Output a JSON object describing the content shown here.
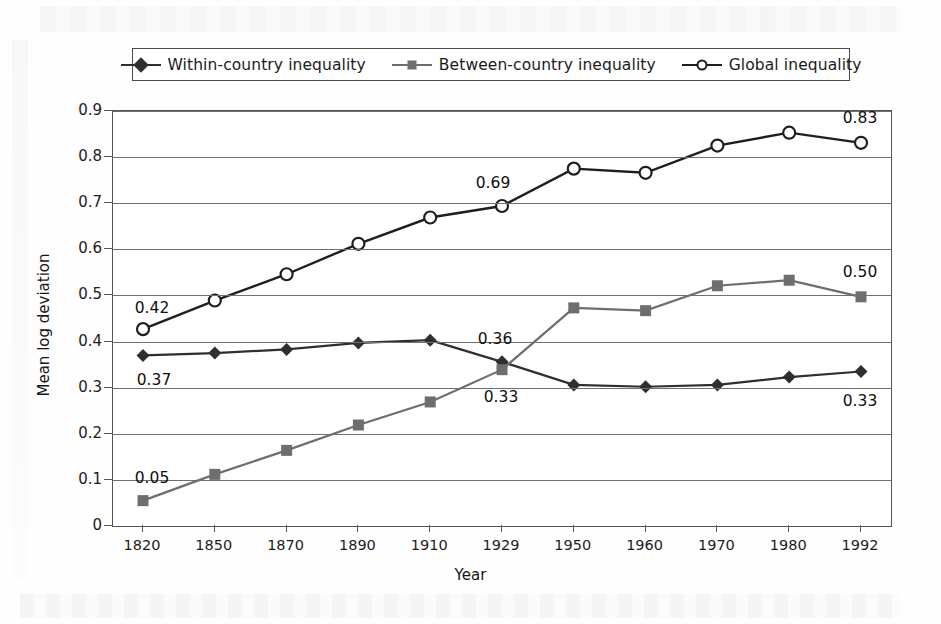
{
  "chart_data": {
    "type": "line",
    "title": "",
    "xlabel": "Year",
    "ylabel": "Mean log deviation",
    "categories": [
      "1820",
      "1850",
      "1870",
      "1890",
      "1910",
      "1929",
      "1950",
      "1960",
      "1970",
      "1980",
      "1992"
    ],
    "ylim": [
      0,
      0.9
    ],
    "ytick_labels": [
      "0",
      "0.1",
      "0.2",
      "0.3",
      "0.4",
      "0.5",
      "0.6",
      "0.7",
      "0.8",
      "0.9"
    ],
    "ytick_values": [
      0,
      0.1,
      0.2,
      0.3,
      0.4,
      0.5,
      0.6,
      0.7,
      0.8,
      0.9
    ],
    "grid": true,
    "legend_position": "top",
    "series": [
      {
        "name": "Within-country inequality",
        "marker": "diamond",
        "color": "#2f2f2f",
        "values": [
          0.37,
          0.375,
          0.383,
          0.397,
          0.403,
          0.356,
          0.306,
          0.302,
          0.306,
          0.323,
          0.335
        ]
      },
      {
        "name": "Between-country inequality",
        "marker": "square",
        "color": "#6e6e6e",
        "values": [
          0.055,
          0.112,
          0.164,
          0.219,
          0.269,
          0.339,
          0.473,
          0.467,
          0.521,
          0.533,
          0.497
        ]
      },
      {
        "name": "Global inequality",
        "marker": "circle",
        "color": "#1e1e1e",
        "values": [
          0.427,
          0.489,
          0.546,
          0.612,
          0.669,
          0.694,
          0.775,
          0.766,
          0.825,
          0.853,
          0.831
        ]
      }
    ],
    "annotations": [
      {
        "text": "0.42",
        "series": "Global inequality",
        "category": "1820",
        "value": 0.427,
        "dx": 10,
        "dy": -20
      },
      {
        "text": "0.37",
        "series": "Within-country inequality",
        "category": "1820",
        "value": 0.37,
        "dx": 12,
        "dy": 26
      },
      {
        "text": "0.05",
        "series": "Between-country inequality",
        "category": "1820",
        "value": 0.055,
        "dx": 10,
        "dy": -22
      },
      {
        "text": "0.69",
        "series": "Global inequality",
        "category": "1929",
        "value": 0.694,
        "dx": -8,
        "dy": -22
      },
      {
        "text": "0.36",
        "series": "Within-country inequality",
        "category": "1929",
        "value": 0.356,
        "dx": -6,
        "dy": -22
      },
      {
        "text": "0.33",
        "series": "Between-country inequality",
        "category": "1929",
        "value": 0.339,
        "dx": 0,
        "dy": 28
      },
      {
        "text": "0.83",
        "series": "Global inequality",
        "category": "1992",
        "value": 0.831,
        "dx": 0,
        "dy": -24
      },
      {
        "text": "0.50",
        "series": "Between-country inequality",
        "category": "1992",
        "value": 0.497,
        "dx": 0,
        "dy": -24
      },
      {
        "text": "0.33",
        "series": "Within-country inequality",
        "category": "1992",
        "value": 0.335,
        "dx": 0,
        "dy": 30
      }
    ]
  },
  "legend": {
    "items": [
      {
        "label": "Within-country inequality",
        "marker": "diamond-marker-icon",
        "color": "#2f2f2f"
      },
      {
        "label": "Between-country inequality",
        "marker": "square-marker-icon",
        "color": "#6e6e6e"
      },
      {
        "label": "Global inequality",
        "marker": "circle-marker-icon",
        "color": "#1e1e1e"
      }
    ]
  },
  "axes": {
    "x_title": "Year",
    "y_title": "Mean log deviation"
  }
}
